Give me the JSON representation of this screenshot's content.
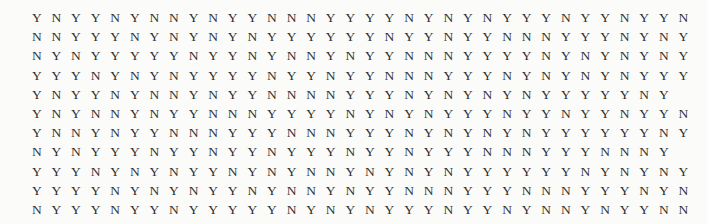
{
  "page": {
    "background_color": "#fbfbfa",
    "text_color": "#2e2e2e",
    "width": 707,
    "height": 224
  },
  "table": {
    "type": "binary-value-grid",
    "symbols": [
      "Y",
      "N"
    ],
    "columns_per_row": 34,
    "row_count": 11,
    "last_row_length": 9,
    "total_cells": 349,
    "rows": [
      [
        "Y",
        "N",
        "Y",
        "Y",
        "N",
        "Y",
        "N",
        "N",
        "Y",
        "N",
        "Y",
        "Y",
        "N",
        "N",
        "N",
        "Y",
        "Y",
        "Y",
        "Y",
        "N",
        "Y",
        "N",
        "Y",
        "N",
        "Y",
        "Y",
        "Y",
        "N",
        "Y",
        "Y",
        "N",
        "Y",
        "Y",
        "N"
      ],
      [
        "N",
        "N",
        "Y",
        "Y",
        "Y",
        "N",
        "Y",
        "N",
        "Y",
        "N",
        "Y",
        "N",
        "Y",
        "Y",
        "Y",
        "Y",
        "Y",
        "Y",
        "N",
        "Y",
        "Y",
        "N",
        "Y",
        "Y",
        "N",
        "N",
        "N",
        "Y",
        "Y",
        "Y",
        "N",
        "Y",
        "N",
        "Y"
      ],
      [
        "N",
        "Y",
        "N",
        "Y",
        "Y",
        "Y",
        "Y",
        "Y",
        "N",
        "Y",
        "Y",
        "N",
        "Y",
        "N",
        "N",
        "Y",
        "N",
        "Y",
        "Y",
        "N",
        "N",
        "N",
        "Y",
        "Y",
        "Y",
        "Y",
        "N",
        "Y",
        "N",
        "Y",
        "N",
        "Y",
        "N",
        "Y"
      ],
      [
        "Y",
        "Y",
        "Y",
        "N",
        "Y",
        "N",
        "Y",
        "N",
        "Y",
        "Y",
        "Y",
        "Y",
        "N",
        "Y",
        "Y",
        "N",
        "Y",
        "Y",
        "N",
        "N",
        "N",
        "Y",
        "Y",
        "Y",
        "N",
        "Y",
        "N",
        "Y",
        "N",
        "Y",
        "N",
        "Y",
        "Y",
        "Y"
      ],
      [
        "Y",
        "N",
        "Y",
        "Y",
        "N",
        "Y",
        "N",
        "N",
        "Y",
        "N",
        "Y",
        "Y",
        "N",
        "N",
        "N",
        "N",
        "Y",
        "Y",
        "Y",
        "N",
        "Y",
        "N",
        "Y",
        "N",
        "Y",
        "N",
        "Y",
        "Y",
        "Y",
        "Y",
        "Y",
        "N",
        "Y"
      ],
      [
        "Y",
        "N",
        "Y",
        "N",
        "N",
        "Y",
        "N",
        "Y",
        "Y",
        "N",
        "N",
        "N",
        "Y",
        "Y",
        "Y",
        "Y",
        "N",
        "Y",
        "N",
        "Y",
        "N",
        "Y",
        "Y",
        "Y",
        "N",
        "Y",
        "Y",
        "N",
        "Y",
        "Y",
        "N",
        "Y",
        "Y",
        "N"
      ],
      [
        "Y",
        "N",
        "N",
        "Y",
        "N",
        "Y",
        "Y",
        "N",
        "N",
        "N",
        "Y",
        "Y",
        "Y",
        "N",
        "N",
        "N",
        "Y",
        "Y",
        "Y",
        "N",
        "Y",
        "N",
        "Y",
        "N",
        "Y",
        "N",
        "Y",
        "Y",
        "Y",
        "Y",
        "Y",
        "Y",
        "N",
        "Y"
      ],
      [
        "N",
        "Y",
        "N",
        "Y",
        "Y",
        "Y",
        "N",
        "Y",
        "Y",
        "N",
        "Y",
        "Y",
        "N",
        "Y",
        "Y",
        "Y",
        "N",
        "Y",
        "Y",
        "N",
        "Y",
        "Y",
        "Y",
        "N",
        "N",
        "N",
        "Y",
        "Y",
        "Y",
        "N",
        "N",
        "N",
        "Y"
      ],
      [
        "Y",
        "Y",
        "Y",
        "N",
        "Y",
        "N",
        "Y",
        "N",
        "Y",
        "Y",
        "N",
        "Y",
        "N",
        "Y",
        "N",
        "N",
        "Y",
        "N",
        "Y",
        "N",
        "Y",
        "N",
        "Y",
        "Y",
        "Y",
        "Y",
        "Y",
        "Y",
        "N",
        "Y",
        "N",
        "Y",
        "N",
        "Y"
      ],
      [
        "Y",
        "Y",
        "Y",
        "Y",
        "N",
        "Y",
        "N",
        "Y",
        "N",
        "Y",
        "Y",
        "N",
        "Y",
        "N",
        "N",
        "Y",
        "N",
        "Y",
        "Y",
        "N",
        "N",
        "N",
        "Y",
        "Y",
        "Y",
        "N",
        "N",
        "N",
        "Y",
        "Y",
        "Y",
        "N",
        "Y",
        "N"
      ],
      [
        "N",
        "Y",
        "Y",
        "Y",
        "N",
        "Y",
        "Y",
        "N",
        "Y",
        "Y",
        "Y",
        "Y",
        "Y",
        "N",
        "Y",
        "N",
        "Y",
        "N",
        "Y",
        "Y",
        "Y",
        "N",
        "Y",
        "Y",
        "N",
        "Y",
        "N",
        "N",
        "Y",
        "N",
        "Y",
        "Y",
        "N",
        "N"
      ],
      [
        "Y",
        "Y",
        "Y",
        "N",
        "Y",
        "Y",
        "N",
        "Y",
        "Y"
      ]
    ]
  }
}
